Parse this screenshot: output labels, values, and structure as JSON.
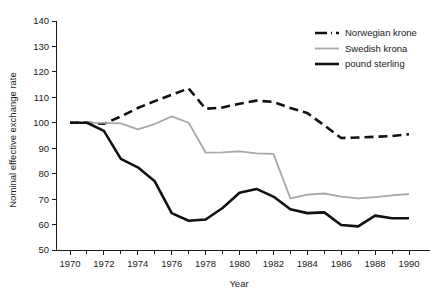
{
  "chart_data": {
    "type": "line",
    "title": "",
    "xlabel": "Year",
    "ylabel": "Nominal effective exchange rate",
    "xlim": [
      1970,
      1990
    ],
    "ylim": [
      50,
      140
    ],
    "ytick_labels": [
      "140",
      "130",
      "120",
      "110",
      "100",
      "90",
      "80",
      "70",
      "60",
      "50"
    ],
    "yticks": [
      140,
      130,
      120,
      110,
      100,
      90,
      80,
      70,
      60,
      50
    ],
    "xtick_labels": [
      "1970",
      "1972",
      "1974",
      "1976",
      "1978",
      "1980",
      "1982",
      "1984",
      "1986",
      "1988",
      "1990"
    ],
    "xticks": [
      1970,
      1972,
      1974,
      1976,
      1978,
      1980,
      1982,
      1984,
      1986,
      1988,
      1990
    ],
    "minor_xticks": [
      1971,
      1973,
      1975,
      1977,
      1979,
      1981,
      1983,
      1985,
      1987,
      1989
    ],
    "grid": false,
    "legend_position": "top-right",
    "x": [
      1970,
      1971,
      1972,
      1973,
      1974,
      1975,
      1976,
      1977,
      1978,
      1979,
      1980,
      1981,
      1982,
      1983,
      1984,
      1985,
      1986,
      1987,
      1988,
      1989,
      1990
    ],
    "series": [
      {
        "name": "Norwegian krone",
        "color": "#111111",
        "style": "dashed",
        "width": 2.6,
        "values": [
          100.0,
          100.0,
          99.6,
          102.5,
          105.8,
          108.5,
          111.0,
          113.5,
          105.5,
          106.0,
          107.5,
          108.7,
          108.2,
          105.8,
          103.8,
          99.0,
          94.0,
          94.2,
          94.5,
          94.8,
          95.5
        ]
      },
      {
        "name": "Swedish krona",
        "color": "#a8a8a8",
        "style": "solid",
        "width": 1.8,
        "values": [
          100.0,
          100.0,
          100.0,
          99.8,
          97.4,
          99.5,
          102.5,
          100.0,
          88.3,
          88.4,
          88.8,
          88.0,
          87.8,
          70.3,
          71.8,
          72.2,
          71.0,
          70.3,
          70.8,
          71.5,
          72.0
        ]
      },
      {
        "name": "pound sterling",
        "color": "#111111",
        "style": "solid",
        "width": 2.6,
        "values": [
          100.0,
          100.0,
          96.8,
          85.8,
          82.5,
          77.0,
          64.5,
          61.5,
          62.0,
          66.5,
          72.5,
          74.0,
          71.0,
          66.0,
          64.5,
          64.8,
          59.8,
          59.3,
          63.5,
          62.5,
          62.5
        ]
      }
    ]
  },
  "legend": {
    "entries": [
      {
        "label": "Norwegian krone"
      },
      {
        "label": "Swedish krona"
      },
      {
        "label": "pound sterling"
      }
    ]
  },
  "axes": {
    "x_title": "Year",
    "y_title": "Nominal effective exchange rate"
  }
}
